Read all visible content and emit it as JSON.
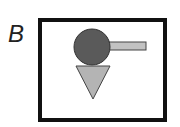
{
  "panel": {
    "label": "B",
    "colors": {
      "frame": "#111111",
      "circle": "#5a5a5a",
      "bar": "#c2c2c2",
      "triangle": "#b4b4b4",
      "outline": "#333333"
    }
  }
}
